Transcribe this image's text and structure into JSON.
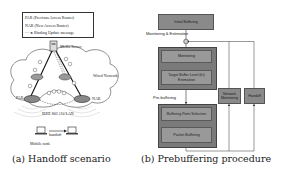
{
  "panel_a": {
    "legend": {
      "items": [
        "PAR (Previous Access Router)",
        "NAR (New Access Router)",
        "Binding Update message"
      ]
    },
    "labels": {
      "media_server": "Media Server",
      "wired_network": "Wired Network",
      "par": "PAR",
      "nar": "NAR",
      "lan": "IEEE 802.11b LAN",
      "handoff": "handoff",
      "mobile_node": "Mobile node"
    },
    "caption": "(a) Handoff scenario"
  },
  "panel_b": {
    "boxes": {
      "initial_buffering": "Initial Buffering",
      "monitoring": "Monitoring",
      "target_buffer": "Target Buffer Level (bₜ) Estimation",
      "buffering_point": "Buffering Point Selection",
      "packet_buffering": "Packet Buffering",
      "network_monitoring": "Network Monitoring",
      "handoff": "Handoff"
    },
    "labels": {
      "monitoring_estimation": "Monitoring & Estimation",
      "pre_buffering": "Pre-buffering"
    },
    "caption": "(b) Prebuffering procedure"
  },
  "colors": {
    "box_fill": "#8a8a8a",
    "inner_box_fill": "#999999",
    "outer_box_fill": "#7a7a7a",
    "line": "#333333"
  }
}
